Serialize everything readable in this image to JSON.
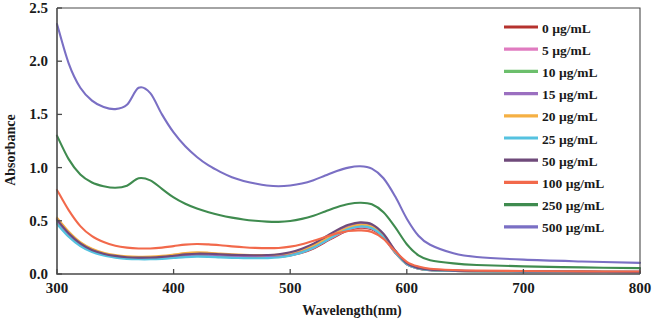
{
  "chart_data": {
    "type": "line",
    "title": "",
    "xlabel": "Wavelength(nm)",
    "ylabel": "Absorbance",
    "xlim": [
      300,
      800
    ],
    "ylim": [
      0.0,
      2.5
    ],
    "xticks": [
      300,
      400,
      500,
      600,
      700,
      800
    ],
    "yticks": [
      "0.0",
      "0.5",
      "1.0",
      "1.5",
      "2.0",
      "2.5"
    ],
    "grid": false,
    "legend_position": "top-right",
    "units": "µg/mL",
    "series": [
      {
        "name": "0 µg/mL",
        "color": "#b5322e",
        "x": [
          300,
          310,
          320,
          330,
          340,
          350,
          360,
          370,
          380,
          390,
          400,
          410,
          420,
          430,
          440,
          450,
          460,
          470,
          480,
          490,
          500,
          510,
          520,
          530,
          540,
          550,
          560,
          570,
          580,
          590,
          600,
          610,
          620,
          640,
          660,
          700,
          750,
          800
        ],
        "y": [
          0.52,
          0.39,
          0.29,
          0.23,
          0.19,
          0.17,
          0.155,
          0.15,
          0.15,
          0.155,
          0.165,
          0.175,
          0.18,
          0.178,
          0.172,
          0.167,
          0.163,
          0.16,
          0.16,
          0.163,
          0.175,
          0.2,
          0.24,
          0.3,
          0.36,
          0.41,
          0.435,
          0.42,
          0.34,
          0.2,
          0.09,
          0.05,
          0.035,
          0.028,
          0.024,
          0.022,
          0.02,
          0.018
        ]
      },
      {
        "name": "5 µg/mL",
        "color": "#e07bc0",
        "x": [
          300,
          310,
          320,
          330,
          340,
          350,
          360,
          370,
          380,
          390,
          400,
          410,
          420,
          430,
          440,
          450,
          460,
          470,
          480,
          490,
          500,
          510,
          520,
          530,
          540,
          550,
          560,
          570,
          580,
          590,
          600,
          610,
          620,
          640,
          660,
          700,
          750,
          800
        ],
        "y": [
          0.5,
          0.375,
          0.28,
          0.22,
          0.185,
          0.165,
          0.152,
          0.148,
          0.148,
          0.153,
          0.162,
          0.172,
          0.177,
          0.175,
          0.17,
          0.165,
          0.161,
          0.159,
          0.159,
          0.163,
          0.177,
          0.205,
          0.247,
          0.307,
          0.367,
          0.418,
          0.443,
          0.427,
          0.345,
          0.203,
          0.092,
          0.051,
          0.036,
          0.029,
          0.025,
          0.022,
          0.02,
          0.018
        ]
      },
      {
        "name": "10 µg/mL",
        "color": "#6cbf6c",
        "x": [
          300,
          310,
          320,
          330,
          340,
          350,
          360,
          370,
          380,
          390,
          400,
          410,
          420,
          430,
          440,
          450,
          460,
          470,
          480,
          490,
          500,
          510,
          520,
          530,
          540,
          550,
          560,
          570,
          580,
          590,
          600,
          610,
          620,
          640,
          660,
          700,
          750,
          800
        ],
        "y": [
          0.48,
          0.36,
          0.27,
          0.213,
          0.18,
          0.16,
          0.148,
          0.144,
          0.145,
          0.15,
          0.159,
          0.169,
          0.174,
          0.172,
          0.167,
          0.162,
          0.159,
          0.157,
          0.158,
          0.163,
          0.18,
          0.21,
          0.253,
          0.313,
          0.375,
          0.427,
          0.452,
          0.435,
          0.352,
          0.207,
          0.094,
          0.052,
          0.037,
          0.03,
          0.026,
          0.023,
          0.021,
          0.019
        ]
      },
      {
        "name": "15 µg/mL",
        "color": "#9b6fc0",
        "x": [
          300,
          310,
          320,
          330,
          340,
          350,
          360,
          370,
          380,
          390,
          400,
          410,
          420,
          430,
          440,
          450,
          460,
          470,
          480,
          490,
          500,
          510,
          520,
          530,
          540,
          550,
          560,
          570,
          580,
          590,
          600,
          610,
          620,
          640,
          660,
          700,
          750,
          800
        ],
        "y": [
          0.5,
          0.375,
          0.282,
          0.222,
          0.187,
          0.167,
          0.155,
          0.151,
          0.151,
          0.156,
          0.165,
          0.176,
          0.182,
          0.18,
          0.175,
          0.17,
          0.167,
          0.165,
          0.166,
          0.172,
          0.19,
          0.222,
          0.267,
          0.33,
          0.395,
          0.448,
          0.474,
          0.457,
          0.37,
          0.218,
          0.1,
          0.056,
          0.04,
          0.032,
          0.028,
          0.024,
          0.022,
          0.02
        ]
      },
      {
        "name": "20 µg/mL",
        "color": "#f5b044",
        "x": [
          300,
          310,
          320,
          330,
          340,
          350,
          360,
          370,
          380,
          390,
          400,
          410,
          420,
          430,
          440,
          450,
          460,
          470,
          480,
          490,
          500,
          510,
          520,
          530,
          540,
          550,
          560,
          570,
          580,
          590,
          600,
          610,
          620,
          640,
          660,
          700,
          750,
          800
        ],
        "y": [
          0.53,
          0.4,
          0.3,
          0.238,
          0.2,
          0.178,
          0.166,
          0.162,
          0.163,
          0.17,
          0.182,
          0.196,
          0.203,
          0.2,
          0.193,
          0.186,
          0.181,
          0.178,
          0.178,
          0.183,
          0.198,
          0.228,
          0.27,
          0.328,
          0.388,
          0.438,
          0.462,
          0.445,
          0.36,
          0.212,
          0.097,
          0.054,
          0.038,
          0.03,
          0.026,
          0.023,
          0.021,
          0.019
        ]
      },
      {
        "name": "25 µg/mL",
        "color": "#55c2e0",
        "x": [
          300,
          310,
          320,
          330,
          340,
          350,
          360,
          370,
          380,
          390,
          400,
          410,
          420,
          430,
          440,
          450,
          460,
          470,
          480,
          490,
          500,
          510,
          520,
          530,
          540,
          550,
          560,
          570,
          580,
          590,
          600,
          610,
          620,
          640,
          660,
          700,
          750,
          800
        ],
        "y": [
          0.47,
          0.35,
          0.262,
          0.206,
          0.173,
          0.154,
          0.142,
          0.138,
          0.138,
          0.142,
          0.15,
          0.159,
          0.163,
          0.161,
          0.156,
          0.152,
          0.149,
          0.148,
          0.149,
          0.155,
          0.172,
          0.203,
          0.247,
          0.308,
          0.37,
          0.422,
          0.447,
          0.43,
          0.348,
          0.205,
          0.093,
          0.051,
          0.036,
          0.029,
          0.025,
          0.022,
          0.02,
          0.018
        ]
      },
      {
        "name": "50 µg/mL",
        "color": "#6f4a7a",
        "x": [
          300,
          310,
          320,
          330,
          340,
          350,
          360,
          370,
          380,
          390,
          400,
          410,
          420,
          430,
          440,
          450,
          460,
          470,
          480,
          490,
          500,
          510,
          520,
          530,
          540,
          550,
          560,
          570,
          580,
          590,
          600,
          610,
          620,
          640,
          660,
          700,
          750,
          800
        ],
        "y": [
          0.51,
          0.383,
          0.287,
          0.226,
          0.191,
          0.17,
          0.158,
          0.154,
          0.155,
          0.161,
          0.172,
          0.184,
          0.191,
          0.19,
          0.185,
          0.18,
          0.177,
          0.176,
          0.178,
          0.185,
          0.204,
          0.238,
          0.285,
          0.348,
          0.412,
          0.462,
          0.485,
          0.468,
          0.378,
          0.222,
          0.101,
          0.056,
          0.04,
          0.032,
          0.028,
          0.025,
          0.022,
          0.02
        ]
      },
      {
        "name": "100 µg/mL",
        "color": "#f2694b",
        "x": [
          300,
          310,
          320,
          330,
          340,
          350,
          360,
          370,
          380,
          390,
          400,
          410,
          420,
          430,
          440,
          450,
          460,
          470,
          480,
          490,
          500,
          510,
          520,
          530,
          540,
          550,
          560,
          570,
          580,
          590,
          600,
          610,
          620,
          640,
          660,
          700,
          750,
          800
        ],
        "y": [
          0.79,
          0.6,
          0.45,
          0.355,
          0.3,
          0.266,
          0.248,
          0.24,
          0.24,
          0.248,
          0.262,
          0.276,
          0.282,
          0.278,
          0.27,
          0.26,
          0.252,
          0.246,
          0.243,
          0.245,
          0.257,
          0.28,
          0.312,
          0.348,
          0.382,
          0.404,
          0.41,
          0.395,
          0.33,
          0.215,
          0.115,
          0.07,
          0.05,
          0.038,
          0.032,
          0.028,
          0.025,
          0.023
        ]
      },
      {
        "name": "250 µg/mL",
        "color": "#3f8b4f",
        "x": [
          300,
          310,
          320,
          330,
          340,
          350,
          360,
          370,
          380,
          390,
          400,
          410,
          420,
          430,
          440,
          450,
          460,
          470,
          480,
          490,
          500,
          510,
          520,
          530,
          540,
          550,
          560,
          570,
          580,
          590,
          600,
          610,
          620,
          640,
          660,
          700,
          750,
          800
        ],
        "y": [
          1.3,
          1.08,
          0.935,
          0.86,
          0.825,
          0.81,
          0.83,
          0.9,
          0.88,
          0.8,
          0.72,
          0.66,
          0.615,
          0.58,
          0.552,
          0.53,
          0.512,
          0.5,
          0.492,
          0.49,
          0.498,
          0.518,
          0.548,
          0.588,
          0.628,
          0.658,
          0.67,
          0.655,
          0.58,
          0.44,
          0.28,
          0.175,
          0.13,
          0.1,
          0.085,
          0.072,
          0.062,
          0.055
        ]
      },
      {
        "name": "500 µg/mL",
        "color": "#7a6fc4",
        "x": [
          300,
          310,
          320,
          330,
          340,
          350,
          360,
          370,
          380,
          390,
          400,
          410,
          420,
          430,
          440,
          450,
          460,
          470,
          480,
          490,
          500,
          510,
          520,
          530,
          540,
          550,
          560,
          570,
          580,
          590,
          600,
          610,
          620,
          640,
          660,
          700,
          750,
          800
        ],
        "y": [
          2.35,
          1.98,
          1.75,
          1.63,
          1.57,
          1.55,
          1.59,
          1.75,
          1.7,
          1.5,
          1.33,
          1.2,
          1.1,
          1.02,
          0.96,
          0.91,
          0.875,
          0.85,
          0.832,
          0.825,
          0.832,
          0.85,
          0.882,
          0.925,
          0.968,
          1.0,
          1.012,
          0.99,
          0.9,
          0.73,
          0.52,
          0.36,
          0.275,
          0.195,
          0.16,
          0.135,
          0.118,
          0.105
        ]
      }
    ]
  },
  "legend": {
    "entries": [
      {
        "label": "0 µg/mL",
        "color": "#b5322e"
      },
      {
        "label": "5 µg/mL",
        "color": "#e07bc0"
      },
      {
        "label": "10 µg/mL",
        "color": "#6cbf6c"
      },
      {
        "label": "15 µg/mL",
        "color": "#9b6fc0"
      },
      {
        "label": "20 µg/mL",
        "color": "#f5b044"
      },
      {
        "label": "25 µg/mL",
        "color": "#55c2e0"
      },
      {
        "label": "50 µg/mL",
        "color": "#6f4a7a"
      },
      {
        "label": "100 µg/mL",
        "color": "#f2694b"
      },
      {
        "label": "250 µg/mL",
        "color": "#3f8b4f"
      },
      {
        "label": "500 µg/mL",
        "color": "#7a6fc4"
      }
    ]
  },
  "axes": {
    "x_title": "Wavelength(nm)",
    "y_title": "Absorbance",
    "x_ticks": [
      "300",
      "400",
      "500",
      "600",
      "700",
      "800"
    ],
    "y_ticks": [
      "0.0",
      "0.5",
      "1.0",
      "1.5",
      "2.0",
      "2.5"
    ]
  },
  "style": {
    "frame_color": "#4a4a4a",
    "text_color": "#1a1a1a",
    "background": "#ffffff"
  }
}
